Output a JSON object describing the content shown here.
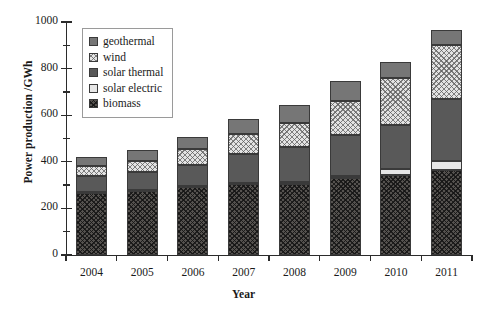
{
  "chart_data": {
    "type": "bar",
    "stacked": true,
    "title": "",
    "xlabel": "Year",
    "ylabel": "Power production /GWh",
    "categories": [
      "2004",
      "2005",
      "2006",
      "2007",
      "2008",
      "2009",
      "2010",
      "2011"
    ],
    "ylim": [
      0,
      1000
    ],
    "yticks": [
      0,
      200,
      400,
      600,
      800,
      1000
    ],
    "ytick_labels": [
      "0",
      "200",
      "400",
      "600",
      "800",
      "1000"
    ],
    "yminor_ticks": [
      100,
      300,
      500,
      700,
      900
    ],
    "grid": false,
    "legend_position": "upper left",
    "series": [
      {
        "name": "biomass",
        "fill": "dark-checkered",
        "color": "#55524f",
        "values": [
          265,
          275,
          290,
          305,
          305,
          330,
          345,
          365
        ]
      },
      {
        "name": "solar electric",
        "fill": "solid-light",
        "color": "#e6e6e6",
        "values": [
          5,
          5,
          5,
          5,
          8,
          10,
          25,
          40
        ]
      },
      {
        "name": "solar thermal",
        "fill": "solid-dark-gray",
        "color": "#595959",
        "values": [
          70,
          75,
          90,
          125,
          150,
          175,
          190,
          265
        ]
      },
      {
        "name": "wind",
        "fill": "light-crosshatch",
        "color": "#e3e3e3",
        "values": [
          40,
          50,
          70,
          85,
          105,
          145,
          200,
          230
        ]
      },
      {
        "name": "geothermal",
        "fill": "solid-mid-gray",
        "color": "#767676",
        "values": [
          40,
          45,
          50,
          65,
          77,
          85,
          70,
          65
        ]
      }
    ],
    "totals": [
      420,
      450,
      505,
      585,
      645,
      745,
      830,
      965
    ]
  },
  "legend": {
    "items": [
      {
        "label": "geothermal"
      },
      {
        "label": "wind"
      },
      {
        "label": "solar thermal"
      },
      {
        "label": "solar electric"
      },
      {
        "label": "biomass"
      }
    ]
  }
}
